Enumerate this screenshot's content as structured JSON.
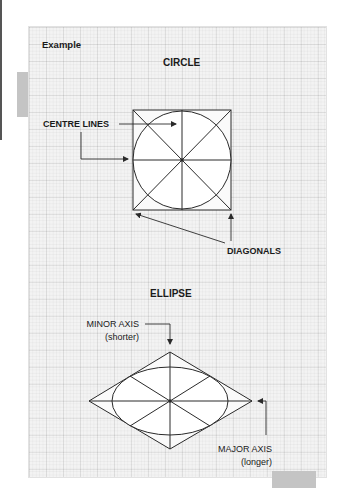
{
  "page": {
    "example_label": "Example"
  },
  "circle": {
    "title": "CIRCLE",
    "centre_lines_label": "CENTRE LINES",
    "diagonals_label": "DIAGONALS"
  },
  "ellipse": {
    "title": "ELLIPSE",
    "minor_axis_label": "MINOR AXIS",
    "minor_axis_note": "(shorter)",
    "major_axis_label": "MAJOR AXIS",
    "major_axis_note": "(longer)"
  },
  "colors": {
    "grid_background": "#f3f3f3",
    "line": "#2a2a2a",
    "shape_fill": "#ffffff",
    "tab": "#c4c4c4"
  }
}
